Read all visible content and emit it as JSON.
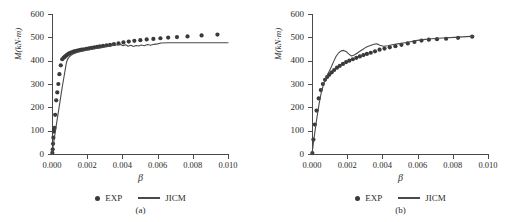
{
  "figure": {
    "panels": [
      "a",
      "b"
    ]
  },
  "chart_data": [
    {
      "type": "scatter",
      "panel_label": "(a)",
      "title": "",
      "xlabel": "β",
      "ylabel": "M(kN·m)",
      "xlim": [
        0,
        0.01
      ],
      "ylim": [
        0,
        600
      ],
      "xticks": [
        0,
        0.002,
        0.004,
        0.006,
        0.008,
        0.01
      ],
      "xtick_labels": [
        "0.000",
        "0.002",
        "0.004",
        "0.006",
        "0.008",
        "0.010"
      ],
      "yticks": [
        0,
        100,
        200,
        300,
        400,
        500,
        600
      ],
      "ytick_labels": [
        "0",
        "100",
        "200",
        "300",
        "400",
        "500",
        "600"
      ],
      "grid": false,
      "legend_position": "below-axes",
      "series": [
        {
          "name": "EXP",
          "type": "scatter",
          "marker": "circle",
          "color": "#3a3a3a",
          "x": [
            2e-05,
            4e-05,
            6e-05,
            8e-05,
            0.0001,
            0.00012,
            0.00014,
            0.00018,
            0.00024,
            0.0003,
            0.00036,
            0.00042,
            0.0005,
            0.00058,
            0.00066,
            0.00072,
            0.00078,
            0.00084,
            0.0009,
            0.00096,
            0.00104,
            0.00112,
            0.00122,
            0.00132,
            0.00144,
            0.00156,
            0.00168,
            0.00182,
            0.00196,
            0.0021,
            0.00224,
            0.0024,
            0.00256,
            0.00272,
            0.0029,
            0.0031,
            0.0033,
            0.00352,
            0.00378,
            0.00406,
            0.00436,
            0.00468,
            0.00502,
            0.00538,
            0.00576,
            0.00616,
            0.0066,
            0.0071,
            0.0077,
            0.0085,
            0.0094
          ],
          "y": [
            5,
            20,
            44,
            70,
            96,
            104,
            112,
            168,
            230,
            264,
            300,
            342,
            380,
            406,
            412,
            416,
            420,
            424,
            427,
            430,
            433,
            436,
            439,
            441,
            443,
            445,
            447,
            449,
            451,
            453,
            455,
            457,
            459,
            461,
            463,
            466,
            468,
            471,
            474,
            478,
            482,
            485,
            488,
            491,
            493,
            496,
            499,
            501,
            504,
            508,
            512
          ]
        },
        {
          "name": "JICM",
          "type": "line",
          "color": "#4a4a4a",
          "x": [
            0.0,
            0.0001,
            0.00022,
            0.00034,
            0.00046,
            0.00058,
            0.00068,
            0.00076,
            0.00082,
            0.0009,
            0.001,
            0.00114,
            0.0013,
            0.0015,
            0.00172,
            0.00196,
            0.00222,
            0.0025,
            0.0028,
            0.0031,
            0.0034,
            0.00368,
            0.0039,
            0.00404,
            0.00418,
            0.00432,
            0.00448,
            0.00462,
            0.00478,
            0.00492,
            0.00508,
            0.00524,
            0.00542,
            0.0056,
            0.0058,
            0.006,
            0.0062,
            0.0066,
            0.0072,
            0.008,
            0.0088,
            0.0096,
            0.01
          ],
          "y": [
            0,
            52,
            112,
            170,
            228,
            286,
            330,
            366,
            392,
            408,
            418,
            426,
            432,
            437,
            441,
            445,
            448,
            452,
            456,
            460,
            464,
            467,
            469,
            464,
            468,
            462,
            466,
            461,
            465,
            463,
            467,
            464,
            469,
            466,
            470,
            472,
            476,
            477,
            477,
            477,
            477,
            477,
            477
          ]
        }
      ]
    },
    {
      "type": "scatter",
      "panel_label": "(b)",
      "title": "",
      "xlabel": "β",
      "ylabel": "M(kN·m)",
      "xlim": [
        0,
        0.01
      ],
      "ylim": [
        0,
        600
      ],
      "xticks": [
        0,
        0.002,
        0.004,
        0.006,
        0.008,
        0.01
      ],
      "xtick_labels": [
        "0.000",
        "0.002",
        "0.004",
        "0.006",
        "0.008",
        "0.010"
      ],
      "yticks": [
        0,
        100,
        200,
        300,
        400,
        500,
        600
      ],
      "ytick_labels": [
        "0",
        "100",
        "200",
        "300",
        "400",
        "500",
        "600"
      ],
      "grid": false,
      "legend_position": "below-axes",
      "series": [
        {
          "name": "EXP",
          "type": "scatter",
          "marker": "circle",
          "color": "#3a3a3a",
          "x": [
            2e-05,
            8e-05,
            0.00016,
            0.00026,
            0.00038,
            0.0005,
            0.00062,
            0.00074,
            0.00086,
            0.00098,
            0.00112,
            0.00126,
            0.00142,
            0.00158,
            0.00176,
            0.00194,
            0.00212,
            0.00232,
            0.00252,
            0.00272,
            0.00292,
            0.00312,
            0.00334,
            0.00358,
            0.00384,
            0.00412,
            0.00442,
            0.00474,
            0.00508,
            0.00544,
            0.00582,
            0.00622,
            0.00664,
            0.0071,
            0.00762,
            0.0083,
            0.0091
          ],
          "y": [
            4,
            62,
            126,
            186,
            238,
            274,
            300,
            318,
            330,
            340,
            350,
            360,
            370,
            378,
            386,
            394,
            400,
            406,
            412,
            418,
            424,
            429,
            434,
            440,
            447,
            452,
            457,
            462,
            468,
            474,
            480,
            486,
            490,
            492,
            494,
            498,
            503
          ]
        },
        {
          "name": "JICM",
          "type": "line",
          "color": "#4a4a4a",
          "x": [
            0.0,
            0.00012,
            0.00026,
            0.0004,
            0.00054,
            0.00068,
            0.00082,
            0.00096,
            0.0011,
            0.00124,
            0.00138,
            0.00152,
            0.00166,
            0.0018,
            0.00196,
            0.0021,
            0.00224,
            0.0024,
            0.00256,
            0.00272,
            0.00288,
            0.00304,
            0.0032,
            0.00336,
            0.00352,
            0.00368,
            0.00386,
            0.00406,
            0.0043,
            0.00456,
            0.00486,
            0.00518,
            0.00552,
            0.0059,
            0.0063,
            0.0068,
            0.0074,
            0.0081,
            0.0088,
            0.0092
          ],
          "y": [
            0,
            70,
            146,
            214,
            268,
            304,
            330,
            352,
            374,
            398,
            420,
            434,
            442,
            444,
            438,
            428,
            420,
            424,
            432,
            440,
            448,
            456,
            462,
            466,
            470,
            472,
            466,
            462,
            464,
            468,
            472,
            476,
            480,
            486,
            490,
            494,
            497,
            500,
            503,
            505
          ]
        }
      ]
    }
  ],
  "legend": {
    "exp_label": "EXP",
    "jicm_label": "JICM"
  },
  "colors": {
    "marker": "#3a3a3a",
    "line": "#4a4a4a",
    "axis": "#4a4a4a",
    "background": "#ffffff"
  }
}
